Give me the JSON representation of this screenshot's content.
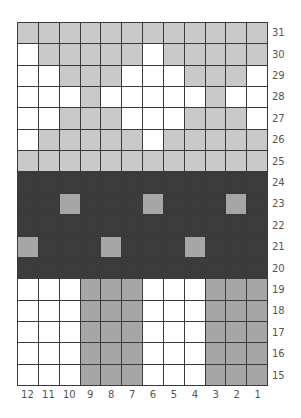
{
  "chart": {
    "title": "",
    "columns": 12,
    "rows": 17,
    "column_labels": [
      "12",
      "11",
      "10",
      "9",
      "8",
      "7",
      "6",
      "5",
      "4",
      "3",
      "2",
      "1"
    ],
    "row_labels": [
      "31",
      "30",
      "29",
      "28",
      "27",
      "26",
      "25",
      "24",
      "23",
      "22",
      "21",
      "20",
      "19",
      "18",
      "17",
      "16",
      "15"
    ],
    "legend": {
      "W": "white",
      "L": "light gray",
      "D": "dark charcoal",
      "M": "medium gray"
    },
    "colors": {
      "W": "#ffffff",
      "L": "#c9c9c9",
      "D": "#3b3b3b",
      "M": "#a6a6a6",
      "grid_line": "#3a3a3a"
    },
    "grid": [
      "LLLLLLLLLLLL",
      "WLLLLLWLLLLL",
      "WWLLLWWWLLLW",
      "WWWLWWWWWLWW",
      "WWLLLWWWLLLW",
      "WLLLLLWLLLLL",
      "LLLLLLLLLLLL",
      "DDDDDDDDDDDD",
      "DDMDDDMDDDMD",
      "DDDDDDDDDDDD",
      "MDDDMDDDMDDD",
      "DDDDDDDDDDDD",
      "WWWMMMWWWMMM",
      "WWWMMMWWWMMM",
      "WWWMMMWWWMMM",
      "WWWMMMWWWMMM",
      "WWWMMMWWWMMM"
    ]
  }
}
